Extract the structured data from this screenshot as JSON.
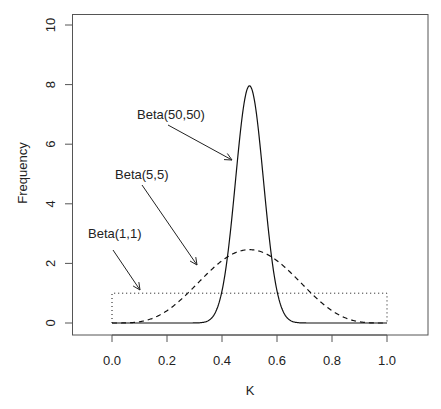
{
  "chart_data": {
    "type": "line",
    "title": "",
    "xlabel": "K",
    "ylabel": "Frequency",
    "xlim": [
      -0.15,
      1.15
    ],
    "ylim": [
      0,
      10
    ],
    "x_ticks": [
      0.0,
      0.2,
      0.4,
      0.6,
      0.8,
      1.0
    ],
    "x_tick_labels": [
      "0.0",
      "0.2",
      "0.4",
      "0.6",
      "0.8",
      "1.0"
    ],
    "y_ticks": [
      0,
      2,
      4,
      6,
      8,
      10
    ],
    "y_tick_labels": [
      "0",
      "2",
      "4",
      "6",
      "8",
      "10"
    ],
    "grid": false,
    "legend": "none (inline arrow annotations)",
    "x": [
      0.0,
      0.1,
      0.2,
      0.3,
      0.4,
      0.5,
      0.6,
      0.7,
      0.8,
      0.9,
      1.0
    ],
    "series": [
      {
        "name": "Beta(50,50)",
        "a": 50,
        "b": 50,
        "style": "solid",
        "values": [
          0,
          0,
          0,
          0.0016,
          1.08,
          7.96,
          1.08,
          0.0016,
          0,
          0,
          0
        ]
      },
      {
        "name": "Beta(5,5)",
        "a": 5,
        "b": 5,
        "style": "dashed",
        "values": [
          0,
          0.041,
          0.413,
          1.225,
          2.09,
          2.461,
          2.09,
          1.225,
          0.413,
          0.041,
          0
        ]
      },
      {
        "name": "Beta(1,1)",
        "a": 1,
        "b": 1,
        "style": "dotted",
        "values": [
          1,
          1,
          1,
          1,
          1,
          1,
          1,
          1,
          1,
          1,
          1
        ]
      }
    ],
    "annotations": [
      {
        "text": "Beta(50,50)",
        "label_x": 137,
        "label_y": 119,
        "arrow": [
          168,
          125,
          232,
          160
        ]
      },
      {
        "text": "Beta(5,5)",
        "label_x": 115,
        "label_y": 179,
        "arrow": [
          142,
          185,
          197,
          265
        ]
      },
      {
        "text": "Beta(1,1)",
        "label_x": 88,
        "label_y": 238,
        "arrow": [
          113,
          250,
          140,
          290
        ]
      }
    ]
  }
}
